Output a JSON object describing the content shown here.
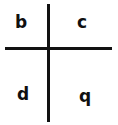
{
  "figure": {
    "background_color": "#ffffff",
    "stroke_color": "#121212",
    "text_color": "#101010",
    "width": 118,
    "height": 125
  },
  "axes": {
    "vertical_line_name": "vertical-divider",
    "horizontal_line_name": "horizontal-divider"
  },
  "quadrants": {
    "top_left": "b",
    "top_right": "c",
    "bottom_left": "d",
    "bottom_right": "q"
  }
}
